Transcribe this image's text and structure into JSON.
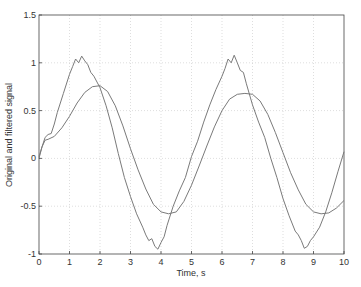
{
  "chart_data": {
    "type": "line",
    "title": "",
    "xlabel": "Time, s",
    "ylabel": "Original and filtered signal",
    "xlim": [
      0,
      10
    ],
    "ylim": [
      -1,
      1.5
    ],
    "xticks": [
      0,
      1,
      2,
      3,
      4,
      5,
      6,
      7,
      8,
      9,
      10
    ],
    "yticks": [
      -1,
      -0.5,
      0,
      0.5,
      1,
      1.5
    ],
    "xtick_labels": [
      "0",
      "1",
      "2",
      "3",
      "4",
      "5",
      "6",
      "7",
      "8",
      "9",
      "10"
    ],
    "ytick_labels": [
      "-1",
      "-0.5",
      "0",
      "0.5",
      "1",
      "1.5"
    ],
    "grid": true,
    "legend": null,
    "series": [
      {
        "name": "original",
        "color": "#7a7a7a",
        "x": [
          0,
          0.1,
          0.2,
          0.3,
          0.4,
          0.5,
          0.6,
          0.8,
          1.0,
          1.1,
          1.2,
          1.3,
          1.4,
          1.5,
          1.6,
          1.7,
          1.8,
          2.0,
          2.2,
          2.4,
          2.6,
          2.8,
          3.0,
          3.2,
          3.4,
          3.5,
          3.6,
          3.7,
          3.8,
          3.9,
          4.0,
          4.1,
          4.2,
          4.4,
          4.6,
          4.8,
          5.0,
          5.2,
          5.4,
          5.6,
          5.8,
          6.0,
          6.1,
          6.2,
          6.3,
          6.4,
          6.5,
          6.6,
          6.7,
          6.8,
          7.0,
          7.2,
          7.4,
          7.6,
          7.8,
          8.0,
          8.2,
          8.4,
          8.5,
          8.6,
          8.7,
          8.8,
          8.9,
          9.0,
          9.2,
          9.4,
          9.6,
          9.8,
          10.0
        ],
        "y": [
          0.02,
          0.12,
          0.22,
          0.25,
          0.26,
          0.36,
          0.48,
          0.68,
          0.88,
          0.96,
          1.04,
          1.0,
          1.07,
          1.02,
          0.98,
          0.9,
          0.86,
          0.74,
          0.55,
          0.32,
          0.05,
          -0.2,
          -0.4,
          -0.58,
          -0.72,
          -0.8,
          -0.86,
          -0.84,
          -0.92,
          -0.95,
          -0.88,
          -0.82,
          -0.7,
          -0.5,
          -0.34,
          -0.2,
          0.02,
          0.18,
          0.38,
          0.56,
          0.72,
          0.86,
          0.94,
          1.04,
          1.0,
          1.08,
          1.0,
          0.92,
          0.9,
          0.78,
          0.56,
          0.38,
          0.22,
          0.0,
          -0.2,
          -0.42,
          -0.6,
          -0.76,
          -0.8,
          -0.86,
          -0.94,
          -0.92,
          -0.86,
          -0.82,
          -0.72,
          -0.56,
          -0.36,
          -0.14,
          0.07
        ]
      },
      {
        "name": "filtered",
        "color": "#7a7a7a",
        "x": [
          0,
          0.1,
          0.2,
          0.3,
          0.5,
          0.75,
          1.0,
          1.25,
          1.5,
          1.75,
          2.0,
          2.25,
          2.5,
          2.75,
          3.0,
          3.25,
          3.5,
          3.75,
          4.0,
          4.25,
          4.5,
          4.75,
          5.0,
          5.25,
          5.5,
          5.75,
          6.0,
          6.25,
          6.5,
          6.75,
          7.0,
          7.25,
          7.5,
          7.75,
          8.0,
          8.25,
          8.5,
          8.75,
          9.0,
          9.25,
          9.5,
          9.75,
          10.0
        ],
        "y": [
          0.0,
          0.12,
          0.19,
          0.2,
          0.23,
          0.32,
          0.44,
          0.58,
          0.69,
          0.75,
          0.76,
          0.7,
          0.55,
          0.34,
          0.1,
          -0.12,
          -0.32,
          -0.48,
          -0.56,
          -0.58,
          -0.56,
          -0.45,
          -0.28,
          -0.08,
          0.13,
          0.33,
          0.5,
          0.62,
          0.67,
          0.68,
          0.67,
          0.6,
          0.46,
          0.27,
          0.06,
          -0.15,
          -0.33,
          -0.48,
          -0.56,
          -0.58,
          -0.57,
          -0.52,
          -0.44
        ]
      }
    ]
  },
  "plot": {
    "grid_color": "#c8c8c8",
    "axis_color": "#444444",
    "top_cut_text": "— — — — — —"
  }
}
